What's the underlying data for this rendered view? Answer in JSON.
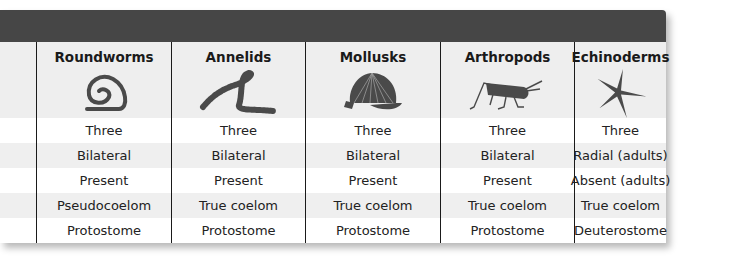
{
  "table": {
    "columns": [
      {
        "name": "Roundworms",
        "icon": "roundworm-icon"
      },
      {
        "name": "Annelids",
        "icon": "annelid-icon"
      },
      {
        "name": "Mollusks",
        "icon": "mollusk-shell-icon"
      },
      {
        "name": "Arthropods",
        "icon": "grasshopper-icon"
      },
      {
        "name": "Echinoderms",
        "icon": "starfish-icon"
      }
    ],
    "rows": [
      [
        "Three",
        "Three",
        "Three",
        "Three",
        "Three"
      ],
      [
        "Bilateral",
        "Bilateral",
        "Bilateral",
        "Bilateral",
        "Radial (adults)"
      ],
      [
        "Present",
        "Present",
        "Present",
        "Present",
        "Absent (adults)"
      ],
      [
        "Pseudocoelom",
        "True coelom",
        "True coelom",
        "True coelom",
        "True coelom"
      ],
      [
        "Protostome",
        "Protostome",
        "Protostome",
        "Protostome",
        "Deuterostome"
      ]
    ]
  },
  "colors": {
    "title_bar": "#464646",
    "header_bg": "#eeeeee",
    "stripe": "#efefef",
    "icon": "#4a4a4a"
  }
}
